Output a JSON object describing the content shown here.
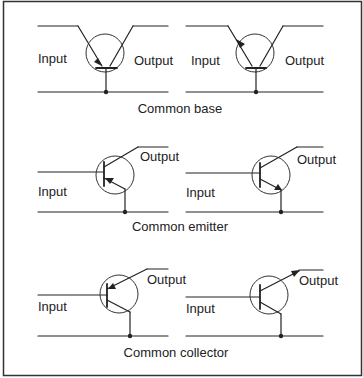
{
  "figure": {
    "sections": [
      {
        "caption": "Common base",
        "left": {
          "input_label": "Input",
          "output_label": "Output",
          "arrow": "emitter-in"
        },
        "right": {
          "input_label": "Input",
          "output_label": "Output",
          "arrow": "emitter-out"
        }
      },
      {
        "caption": "Common emitter",
        "left": {
          "input_label": "Input",
          "output_label": "Output",
          "arrow": "emitter-in"
        },
        "right": {
          "input_label": "Input",
          "output_label": "Output",
          "arrow": "emitter-out"
        }
      },
      {
        "caption": "Common collector",
        "left": {
          "input_label": "Input",
          "output_label": "Output",
          "arrow": "emitter-in"
        },
        "right": {
          "input_label": "Input",
          "output_label": "Output",
          "arrow": "emitter-out"
        }
      }
    ]
  },
  "colors": {
    "line": "#222222",
    "border": "#333333",
    "background": "#ffffff"
  }
}
